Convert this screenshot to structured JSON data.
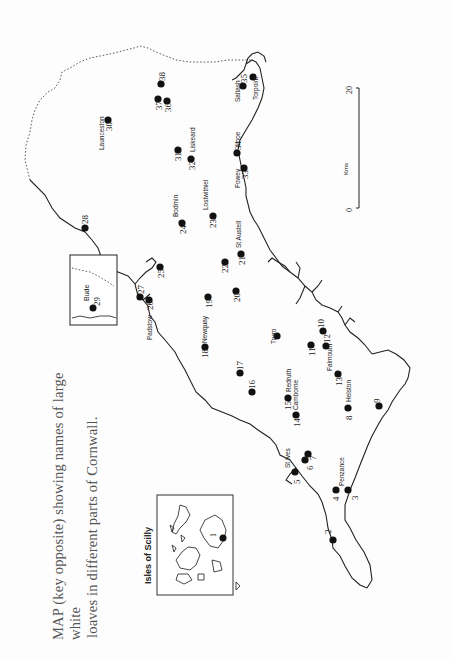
{
  "caption": {
    "line1": "MAP (key opposite) showing names of large white",
    "line2": "loaves in different parts of Cornwall."
  },
  "map": {
    "orientation": "rotated 90deg counter-clockwise",
    "inset_scilly": {
      "title": "Isles of Scilly",
      "points": [
        {
          "n": "1",
          "label": ""
        }
      ]
    },
    "inset_bude": {
      "points": [
        {
          "n": "29",
          "label": "Bude"
        }
      ]
    },
    "scale_bar": {
      "unit": "Kms",
      "start": "0",
      "end": "20"
    },
    "places": [
      {
        "n": "2",
        "label": ""
      },
      {
        "n": "3",
        "label": "Penzance"
      },
      {
        "n": "4",
        "label": ""
      },
      {
        "n": "5",
        "label": "St Ives"
      },
      {
        "n": "6",
        "label": ""
      },
      {
        "n": "7",
        "label": ""
      },
      {
        "n": "8",
        "label": "Helston"
      },
      {
        "n": "9",
        "label": ""
      },
      {
        "n": "10",
        "label": ""
      },
      {
        "n": "11",
        "label": ""
      },
      {
        "n": "12",
        "label": "Falmouth"
      },
      {
        "n": "13",
        "label": ""
      },
      {
        "n": "14",
        "label": "Camborne"
      },
      {
        "n": "15",
        "label": "Redruth"
      },
      {
        "n": "16",
        "label": ""
      },
      {
        "n": "17",
        "label": ""
      },
      {
        "n": "18",
        "label": "Newquay"
      },
      {
        "n": "19",
        "label": ""
      },
      {
        "n": "20",
        "label": ""
      },
      {
        "n": "21",
        "label": "St Austell"
      },
      {
        "n": "22",
        "label": ""
      },
      {
        "n": "23",
        "label": "Lostwithiel"
      },
      {
        "n": "24",
        "label": "Bodmin"
      },
      {
        "n": "25",
        "label": ""
      },
      {
        "n": "26",
        "label": "Padstow"
      },
      {
        "n": "27",
        "label": ""
      },
      {
        "n": "28",
        "label": ""
      },
      {
        "n": "30",
        "label": "Launceston"
      },
      {
        "n": "31",
        "label": ""
      },
      {
        "n": "32",
        "label": "Liskeard"
      },
      {
        "n": "33",
        "label": "Fowey"
      },
      {
        "n": "34",
        "label": "Looe"
      },
      {
        "n": "35",
        "label": "Saltash"
      },
      {
        "n": "36",
        "label": ""
      },
      {
        "n": "37",
        "label": ""
      },
      {
        "n": "38",
        "label": ""
      }
    ],
    "extra_labels": {
      "truro": "Truro",
      "torpoint": "Torpoint"
    }
  }
}
